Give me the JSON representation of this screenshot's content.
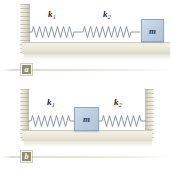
{
  "figure": {
    "kind": "physics-diagram",
    "colors": {
      "wall": "#e9e6d6",
      "floor": "#efeddf",
      "block": "#bed0e2",
      "block_border": "#8fa6bd",
      "spring": "#6f7d8c",
      "badge": "#8f8f73",
      "label_text": "#1d2126",
      "background": "#ffffff"
    }
  },
  "panels": [
    {
      "id": "a",
      "caption": "a",
      "layout": "series-springs-wall-left",
      "walls": [
        "left"
      ],
      "springs": [
        {
          "name": "k1",
          "label": "k",
          "subscript": "1",
          "coils": 15
        },
        {
          "name": "k2",
          "label": "k",
          "subscript": "2",
          "coils": 13
        }
      ],
      "mass": {
        "label": "m",
        "position": "right-end"
      }
    },
    {
      "id": "b",
      "caption": "b",
      "layout": "mass-between-springs-two-walls",
      "walls": [
        "left",
        "right"
      ],
      "springs": [
        {
          "name": "k1",
          "label": "k",
          "subscript": "1",
          "coils": 13
        },
        {
          "name": "k2",
          "label": "k",
          "subscript": "2",
          "coils": 13
        }
      ],
      "mass": {
        "label": "m",
        "position": "center"
      }
    }
  ]
}
